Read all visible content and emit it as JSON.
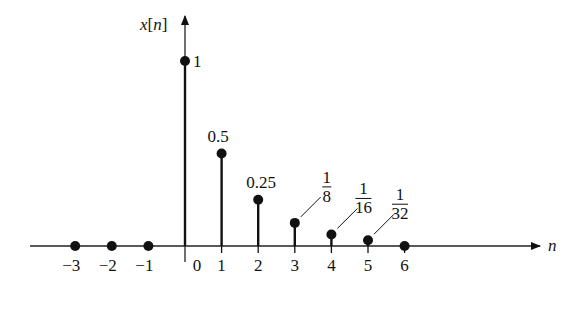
{
  "chart_data": {
    "type": "stem",
    "title": "",
    "ylabel": "x[n]",
    "xlabel": "n",
    "x_ticks": [
      "−3",
      "−2",
      "−1",
      "0",
      "1",
      "2",
      "3",
      "4",
      "5",
      "6"
    ],
    "points": [
      {
        "n": -3,
        "value": 0
      },
      {
        "n": -2,
        "value": 0
      },
      {
        "n": -1,
        "value": 0
      },
      {
        "n": 0,
        "value": 1,
        "label": "1"
      },
      {
        "n": 1,
        "value": 0.5,
        "label": "0.5"
      },
      {
        "n": 2,
        "value": 0.25,
        "label": "0.25"
      },
      {
        "n": 3,
        "value": 0.125,
        "label_num": "1",
        "label_den": "8"
      },
      {
        "n": 4,
        "value": 0.0625,
        "label_num": "1",
        "label_den": "16"
      },
      {
        "n": 5,
        "value": 0.03125,
        "label_num": "1",
        "label_den": "32"
      },
      {
        "n": 6,
        "value": 0
      }
    ],
    "grid": false,
    "legend": null
  }
}
